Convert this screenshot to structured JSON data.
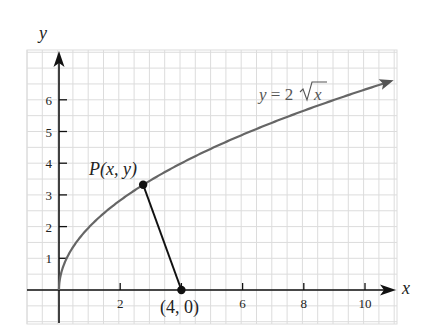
{
  "diagram": {
    "axes": {
      "x_label": "x",
      "y_label": "y",
      "x_ticks": [
        "2",
        "4",
        "6",
        "8",
        "10"
      ],
      "x_tick_labels_shown": [
        "2",
        "6",
        "8",
        "10"
      ],
      "y_ticks": [
        "1",
        "2",
        "3",
        "4",
        "5",
        "6"
      ]
    },
    "curve": {
      "label_prefix": "y = 2",
      "label_radicand": "x",
      "equation": "y = 2√x",
      "color": "#666666"
    },
    "point_p": {
      "label_text": "P(x, y)",
      "x": 2.75,
      "y": 3.32
    },
    "point_fixed": {
      "label_text": "(4, 0)",
      "x": 4,
      "y": 0
    },
    "colors": {
      "grid": "#dcdcdc",
      "axis": "#111111",
      "segment": "#111111",
      "curve": "#666666"
    }
  }
}
